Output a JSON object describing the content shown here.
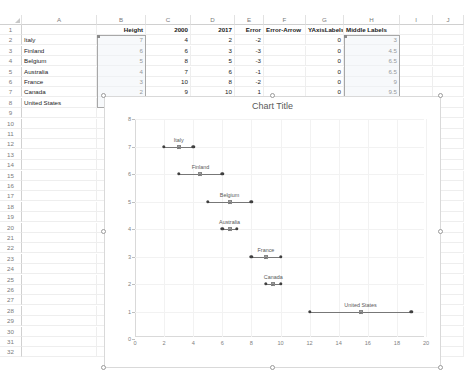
{
  "sheet": {
    "columns": [
      "A",
      "B",
      "C",
      "D",
      "E",
      "F",
      "G",
      "H",
      "I",
      "J"
    ],
    "rows": [
      1,
      2,
      3,
      4,
      5,
      6,
      7,
      8,
      9,
      10,
      11,
      12,
      13,
      14,
      15,
      16,
      17,
      18,
      19,
      20,
      21,
      22,
      23,
      24,
      25,
      26,
      27,
      28,
      29,
      30,
      31,
      32
    ],
    "headers": {
      "A": "",
      "B": "Height",
      "C": "2000",
      "D": "2017",
      "E": "Error",
      "F": "Error-Arrow",
      "G": "YAxisLabels",
      "H": "Middle Labels",
      "I": "",
      "J": ""
    },
    "data_rows": [
      {
        "row": 2,
        "A": "Italy",
        "B": "7",
        "C": "4",
        "D": "2",
        "E": "-2",
        "F": "",
        "G": "0",
        "H": "3"
      },
      {
        "row": 3,
        "A": "Finland",
        "B": "6",
        "C": "6",
        "D": "3",
        "E": "-3",
        "F": "",
        "G": "0",
        "H": "4.5"
      },
      {
        "row": 4,
        "A": "Belgium",
        "B": "5",
        "C": "8",
        "D": "5",
        "E": "-3",
        "F": "",
        "G": "0",
        "H": "6.5"
      },
      {
        "row": 5,
        "A": "Australia",
        "B": "4",
        "C": "7",
        "D": "6",
        "E": "-1",
        "F": "",
        "G": "0",
        "H": "6.5"
      },
      {
        "row": 6,
        "A": "France",
        "B": "3",
        "C": "10",
        "D": "8",
        "E": "-2",
        "F": "",
        "G": "0",
        "H": "9"
      },
      {
        "row": 7,
        "A": "Canada",
        "B": "2",
        "C": "9",
        "D": "10",
        "E": "1",
        "F": "",
        "G": "0",
        "H": "9.5"
      },
      {
        "row": 8,
        "A": "United States",
        "B": "1",
        "C": "12",
        "D": "19",
        "E": "7",
        "F": "",
        "G": "0",
        "H": "15.5"
      }
    ],
    "selections": [
      {
        "name": "height-column-selection",
        "col": "B",
        "from_row": 2,
        "to_row": 8
      },
      {
        "name": "middle-labels-column-selection",
        "col": "H",
        "from_row": 2,
        "to_row": 8
      }
    ]
  },
  "chart": {
    "title": "Chart Title",
    "selected": true
  },
  "chart_data": {
    "type": "scatter",
    "title": "Chart Title",
    "xlabel": "",
    "ylabel": "",
    "xlim": [
      0,
      20
    ],
    "ylim": [
      0,
      8
    ],
    "xticks": [
      0,
      2,
      4,
      6,
      8,
      10,
      12,
      14,
      16,
      18,
      20
    ],
    "yticks": [
      0,
      1,
      2,
      3,
      4,
      5,
      6,
      7,
      8
    ],
    "grid": true,
    "legend": "none",
    "series": [
      {
        "name": "2000",
        "x": [
          4,
          6,
          8,
          7,
          10,
          9,
          12
        ],
        "y": [
          7,
          6,
          5,
          4,
          3,
          2,
          1
        ]
      },
      {
        "name": "2017",
        "x": [
          2,
          3,
          5,
          6,
          8,
          10,
          19
        ],
        "y": [
          7,
          6,
          5,
          4,
          3,
          2,
          1
        ]
      },
      {
        "name": "Middle Labels",
        "x": [
          3,
          4.5,
          6.5,
          6.5,
          9,
          9.5,
          15.5
        ],
        "y": [
          7,
          6,
          5,
          4,
          3,
          2,
          1
        ]
      }
    ],
    "annotations": [
      {
        "text": "Italy",
        "x": 3,
        "y": 7
      },
      {
        "text": "Finland",
        "x": 4.5,
        "y": 6
      },
      {
        "text": "Belgium",
        "x": 6.5,
        "y": 5
      },
      {
        "text": "Australia",
        "x": 6.5,
        "y": 4
      },
      {
        "text": "France",
        "x": 9,
        "y": 3
      },
      {
        "text": "Canada",
        "x": 9.5,
        "y": 2
      },
      {
        "text": "United States",
        "x": 15.5,
        "y": 1
      }
    ]
  }
}
